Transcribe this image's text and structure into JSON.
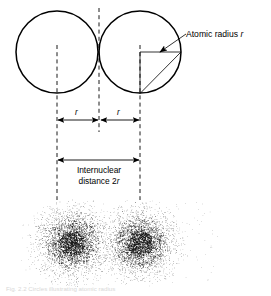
{
  "figure": {
    "title_text": "Atomic radius r",
    "caption": "Fig. 2.2  Circles illustrating atomic radius",
    "labels": {
      "atomic_radius": "Atomic radius ",
      "atomic_radius_symbol": "r",
      "radius_left": "r",
      "radius_right": "r",
      "internuclear_line1": "Internuclear",
      "internuclear_line2": "distance 2",
      "internuclear_symbol": "r"
    },
    "colors": {
      "stroke": "#000000",
      "background": "#ffffff",
      "dots": "#1a1a1a",
      "caption": "#d8d8d8"
    },
    "geometry": {
      "left_circle_cx": 57,
      "left_circle_cy": 52,
      "left_circle_r": 41,
      "right_circle_cx": 140,
      "right_circle_cy": 52,
      "right_circle_r": 41,
      "axis_left_x": 57,
      "axis_mid_x": 99,
      "axis_right_x": 140,
      "dim_r_y": 120,
      "dim_internuclear_y": 160,
      "cloud_left_cx": 72,
      "cloud_right_cx": 140,
      "cloud_cy": 243
    }
  },
  "chart_data": {
    "type": "diagram",
    "elements": [
      {
        "name": "left-atom-circle",
        "shape": "circle",
        "cx": 57,
        "cy": 52,
        "r": 41
      },
      {
        "name": "right-atom-circle",
        "shape": "circle",
        "cx": 140,
        "cy": 52,
        "r": 41
      },
      {
        "name": "radius-wedge",
        "shape": "polygon",
        "points": "140,52 181,52 140,93"
      },
      {
        "name": "dimension-r-left",
        "value": "r",
        "from_x": 57,
        "to_x": 99
      },
      {
        "name": "dimension-r-right",
        "value": "r",
        "from_x": 99,
        "to_x": 140
      },
      {
        "name": "dimension-internuclear",
        "value": "2r",
        "from_x": 57,
        "to_x": 140
      },
      {
        "name": "electron-cloud-left",
        "cx": 72,
        "cy": 243
      },
      {
        "name": "electron-cloud-right",
        "cx": 140,
        "cy": 243
      }
    ]
  }
}
